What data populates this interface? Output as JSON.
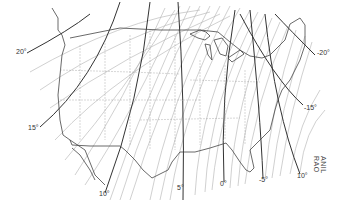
{
  "map": {
    "subject": "Magnetic declination (isogonic lines) over the contiguous United States",
    "major_labels": [
      {
        "text": "20°",
        "x": 16,
        "y": 52
      },
      {
        "text": "15°",
        "x": 28,
        "y": 128
      },
      {
        "text": "10°",
        "x": 99,
        "y": 194
      },
      {
        "text": "5°",
        "x": 177,
        "y": 188
      },
      {
        "text": "0°",
        "x": 220,
        "y": 184
      },
      {
        "text": "-5°",
        "x": 259,
        "y": 180
      },
      {
        "text": "10°",
        "x": 297,
        "y": 176
      },
      {
        "text": "-15°",
        "x": 304,
        "y": 108
      },
      {
        "text": "-20°",
        "x": 317,
        "y": 53
      }
    ],
    "credit": "ANIL RAO",
    "colors": {
      "major_line": "#333333",
      "minor_line": "#aaaaaa",
      "border": "#444444",
      "state_border": "#999999"
    }
  }
}
